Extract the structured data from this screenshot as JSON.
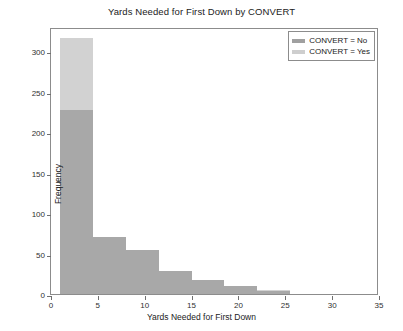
{
  "chart_data": {
    "type": "bar",
    "title": "Yards Needed for First Down by CONVERT",
    "xlabel": "Yards Needed for First Down",
    "ylabel": "Frequency",
    "xlim": [
      0,
      35
    ],
    "ylim": [
      0,
      330
    ],
    "grid": false,
    "legend_position": "top-right",
    "stacked": true,
    "bin_width": 3.5,
    "bin_edges": [
      1,
      4.5,
      8,
      11.5,
      15,
      18.5,
      22,
      25.5,
      29
    ],
    "x_ticks": [
      0,
      5,
      10,
      15,
      20,
      25,
      30,
      35
    ],
    "y_ticks": [
      0,
      50,
      100,
      150,
      200,
      250,
      300
    ],
    "series": [
      {
        "name": "CONVERT = No",
        "color": "#a8a8a8",
        "values": [
          227,
          70,
          55,
          28,
          17,
          10,
          4,
          0
        ]
      },
      {
        "name": "CONVERT = Yes",
        "color": "#d2d2d2",
        "values": [
          90,
          0,
          0,
          0,
          0,
          0,
          1,
          0
        ]
      }
    ],
    "totals": [
      317,
      70,
      55,
      28,
      17,
      10,
      5,
      0
    ]
  },
  "legend": {
    "entries": [
      {
        "label": "CONVERT = No",
        "swatch": "sw-no"
      },
      {
        "label": "CONVERT = Yes",
        "swatch": "sw-yes"
      }
    ]
  }
}
